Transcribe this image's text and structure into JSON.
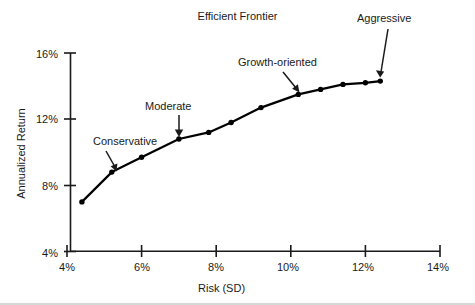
{
  "chart_data": {
    "type": "line",
    "title": "Efficient Frontier",
    "xlabel": "Risk (SD)",
    "ylabel": "Annualized Return",
    "xlim": [
      4,
      14
    ],
    "ylim": [
      4,
      16
    ],
    "grid": false,
    "legend": "none",
    "marker": "filled-circle",
    "line_color": "#000000",
    "x_ticks": [
      "4%",
      "6%",
      "8%",
      "10%",
      "12%",
      "14%"
    ],
    "x_tick_values": [
      4,
      6,
      8,
      10,
      12,
      14
    ],
    "y_ticks": [
      "4%",
      "8%",
      "12%",
      "16%"
    ],
    "y_tick_values": [
      4,
      8,
      12,
      16
    ],
    "series": [
      {
        "name": "Efficient Frontier",
        "x": [
          4.4,
          5.2,
          6.0,
          7.0,
          7.8,
          8.4,
          9.2,
          10.2,
          10.8,
          11.4,
          12.0,
          12.4
        ],
        "y": [
          7.0,
          8.8,
          9.7,
          10.8,
          11.2,
          11.8,
          12.7,
          13.5,
          13.8,
          14.1,
          14.2,
          14.3
        ]
      }
    ],
    "annotations": [
      {
        "text": "Conservative",
        "label_x": 4.7,
        "label_y": 10.2,
        "point_x": 5.2,
        "point_y": 8.8
      },
      {
        "text": "Moderate",
        "label_x": 7.0,
        "label_y": 12.4,
        "point_x": 7.0,
        "point_y": 10.8
      },
      {
        "text": "Growth-oriented",
        "label_x": 9.6,
        "label_y": 15.1,
        "point_x": 10.2,
        "point_y": 13.5
      },
      {
        "text": "Aggressive",
        "label_x": 12.4,
        "label_y": 15.9,
        "point_x": 12.4,
        "point_y": 14.3
      }
    ]
  },
  "axes": {
    "y_tick_0": "16%",
    "y_tick_1": "12%",
    "y_tick_2": "8%",
    "y_tick_3": "4%",
    "x_tick_0": "4%",
    "x_tick_1": "6%",
    "x_tick_2": "8%",
    "x_tick_3": "10%",
    "x_tick_4": "12%",
    "x_tick_5": "14%"
  },
  "annotation_labels": {
    "conservative": "Conservative",
    "moderate": "Moderate",
    "growth": "Growth-oriented",
    "aggressive": "Aggressive"
  }
}
